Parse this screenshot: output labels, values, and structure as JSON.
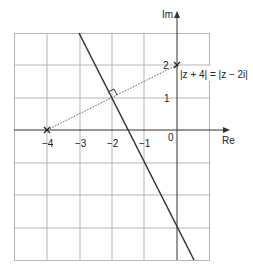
{
  "diagram": {
    "type": "argand-diagram",
    "axes": {
      "real_label": "Re",
      "imag_label": "Im",
      "origin_label": "0"
    },
    "x_ticks": [
      {
        "value": -4,
        "label": "−4"
      },
      {
        "value": -3,
        "label": "−3"
      },
      {
        "value": -2,
        "label": "−2"
      },
      {
        "value": -1,
        "label": "−1"
      }
    ],
    "y_ticks": [
      {
        "value": 1,
        "label": "1"
      },
      {
        "value": 2,
        "label": "2"
      }
    ],
    "grid": {
      "x_range": [
        -4,
        1
      ],
      "y_range": [
        -4,
        3
      ],
      "x_min_line": -5,
      "x_max_line": 1
    },
    "points": [
      {
        "name": "-4",
        "re": -4,
        "im": 0,
        "marker": "cross"
      },
      {
        "name": "2i",
        "re": 0,
        "im": 2,
        "marker": "cross"
      }
    ],
    "segment": {
      "from": [
        -4,
        0
      ],
      "to": [
        0,
        2
      ],
      "style": "dotted"
    },
    "perpendicular_bisector": {
      "through": [
        -3,
        3
      ],
      "to": [
        0.5,
        -4
      ],
      "equation": "|z + 4| = |z − 2i|",
      "right_angle_at": [
        -2,
        1
      ]
    },
    "equation_label": "|z + 4| = |z − 2i|",
    "colors": {
      "grid": "#b0b0b0",
      "axis": "#333333",
      "line": "#333333"
    }
  }
}
